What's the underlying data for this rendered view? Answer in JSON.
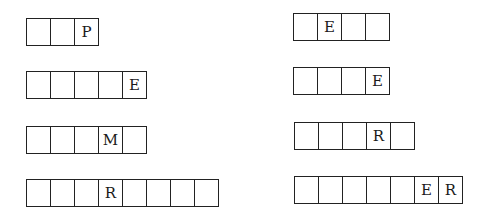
{
  "puzzle": {
    "left": [
      {
        "cells": [
          "",
          "",
          "P"
        ]
      },
      {
        "cells": [
          "",
          "",
          "",
          "",
          "E"
        ]
      },
      {
        "cells": [
          "",
          "",
          "",
          "M",
          ""
        ]
      },
      {
        "cells": [
          "",
          "",
          "",
          "R",
          "",
          "",
          "",
          ""
        ]
      }
    ],
    "right": [
      {
        "cells": [
          "",
          "E",
          "",
          ""
        ]
      },
      {
        "cells": [
          "",
          "",
          "",
          "E"
        ]
      },
      {
        "cells": [
          "",
          "",
          "",
          "R",
          ""
        ]
      },
      {
        "cells": [
          "",
          "",
          "",
          "",
          "",
          "E",
          "R"
        ]
      }
    ]
  }
}
